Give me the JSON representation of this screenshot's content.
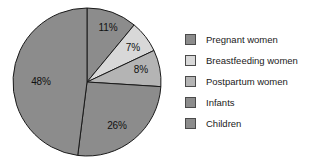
{
  "chart_data": {
    "type": "pie",
    "title": "",
    "subtitle": "",
    "xlabel": "",
    "ylabel": "",
    "grid": false,
    "legend_position": "right",
    "start_angle_deg": 0,
    "direction": "clockwise",
    "center": {
      "cx": 87,
      "cy": 82,
      "r": 74
    },
    "categories": [
      "Pregnant women",
      "Breastfeeding women",
      "Postpartum women",
      "Infants",
      "Children"
    ],
    "values": [
      11,
      7,
      8,
      26,
      48
    ],
    "value_labels": [
      "11%",
      "7%",
      "8%",
      "26%",
      "48%"
    ],
    "colors": [
      "#8c8c8c",
      "#d8d8d8",
      "#b4b4b4",
      "#8c8c8c",
      "#8c8c8c"
    ],
    "slice_label_positions": [
      {
        "x": 108,
        "y": 27
      },
      {
        "x": 133,
        "y": 47
      },
      {
        "x": 141,
        "y": 69
      },
      {
        "x": 117,
        "y": 125
      },
      {
        "x": 41,
        "y": 81
      }
    ],
    "stroke_color": "#1a1a1a",
    "stroke_width": 1
  },
  "legend": {
    "items": [
      {
        "label": "Pregnant women",
        "color": "#8c8c8c",
        "swatch_name": "legend-swatch-pregnant-women"
      },
      {
        "label": "Breastfeeding women",
        "color": "#d8d8d8",
        "swatch_name": "legend-swatch-breastfeeding-women"
      },
      {
        "label": "Postpartum women",
        "color": "#b4b4b4",
        "swatch_name": "legend-swatch-postpartum-women"
      },
      {
        "label": "Infants",
        "color": "#8c8c8c",
        "swatch_name": "legend-swatch-infants"
      },
      {
        "label": "Children",
        "color": "#8c8c8c",
        "swatch_name": "legend-swatch-children"
      }
    ]
  }
}
